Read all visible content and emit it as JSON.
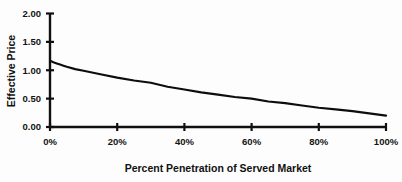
{
  "chart_data": {
    "type": "line",
    "title": "",
    "xlabel": "Percent Penetration of Served Market",
    "ylabel": "Effective Price",
    "xlim": [
      0,
      100
    ],
    "ylim": [
      0,
      2.0
    ],
    "grid": false,
    "legend": false,
    "x_tick_labels": [
      "0%",
      "20%",
      "40%",
      "60%",
      "80%",
      "100%"
    ],
    "x_tick_values": [
      0,
      20,
      40,
      60,
      80,
      100
    ],
    "y_tick_labels": [
      "0.00",
      "0.50",
      "1.00",
      "1.50",
      "2.00"
    ],
    "y_tick_values": [
      0.0,
      0.5,
      1.0,
      1.5,
      2.0
    ],
    "series": [
      {
        "name": "Effective Price",
        "color": "#0d0d0d",
        "x": [
          0,
          1,
          2,
          3,
          4,
          5,
          7.5,
          10,
          12.5,
          15,
          20,
          25,
          30,
          35,
          40,
          45,
          50,
          55,
          60,
          65,
          70,
          75,
          80,
          85,
          90,
          95,
          100
        ],
        "values": [
          1.17,
          1.14,
          1.12,
          1.1,
          1.08,
          1.06,
          1.02,
          0.99,
          0.96,
          0.93,
          0.87,
          0.82,
          0.78,
          0.71,
          0.66,
          0.61,
          0.57,
          0.53,
          0.5,
          0.45,
          0.42,
          0.38,
          0.34,
          0.31,
          0.28,
          0.24,
          0.2
        ]
      }
    ],
    "annotations": []
  },
  "axes": {
    "x_title": "Percent Penetration of Served Market",
    "y_title": "Effective Price"
  },
  "colors": {
    "background": "#fdfdfd",
    "ink": "#101010",
    "curve": "#0d0d0d"
  }
}
